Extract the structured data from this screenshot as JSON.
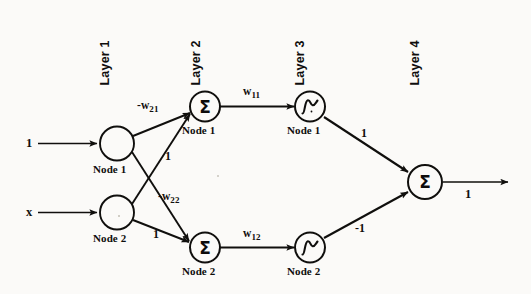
{
  "figure": {
    "background_color": "#fbfaf8",
    "ink_color": "#100f0d"
  },
  "layers": [
    {
      "id": "layer-1",
      "label": "Layer 1"
    },
    {
      "id": "layer-2",
      "label": "Layer 2"
    },
    {
      "id": "layer-3",
      "label": "Layer 3"
    },
    {
      "id": "layer-4",
      "label": "Layer 4"
    }
  ],
  "nodes": {
    "l1n1": {
      "caption": "Node 1",
      "symbol": ""
    },
    "l1n2": {
      "caption": "Node 2",
      "symbol": ""
    },
    "l2n1": {
      "caption": "Node 1",
      "symbol": "Σ"
    },
    "l2n2": {
      "caption": "Node 2",
      "symbol": "Σ"
    },
    "l3n1": {
      "caption": "Node 1",
      "symbol": "sigmoid"
    },
    "l3n2": {
      "caption": "Node 2",
      "symbol": "sigmoid"
    },
    "l4n1": {
      "caption": "",
      "symbol": "Σ"
    }
  },
  "inputs": [
    {
      "id": "bias-input",
      "label": "1"
    },
    {
      "id": "x-input",
      "label": "x"
    }
  ],
  "output": {
    "label": "1"
  },
  "edge_labels": {
    "w21": {
      "sign": "-",
      "base": "w",
      "sub": "21"
    },
    "w22": {
      "sign": "-",
      "base": "w",
      "sub": "22"
    },
    "w11": {
      "sign": "",
      "base": "w",
      "sub": "11"
    },
    "w12": {
      "sign": "",
      "base": "w",
      "sub": "12"
    },
    "l1n1_to_l2n2": "1",
    "l1n2_to_l2n1": "1",
    "l3n1_to_l4": "1",
    "l3n2_to_l4": "-1"
  }
}
